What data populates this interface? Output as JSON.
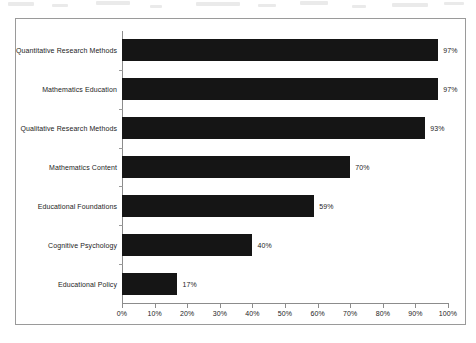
{
  "chart_data": {
    "type": "bar",
    "orientation": "horizontal",
    "title": "",
    "subtitle": "",
    "xlabel": "",
    "ylabel": "",
    "xlim": [
      0,
      100
    ],
    "grid": false,
    "legend": null,
    "categories": [
      "Quantitative Research Methods",
      "Mathematics Education",
      "Qualitative Research Methods",
      "Mathematics Content",
      "Educational Foundations",
      "Cognitive Psychology",
      "Educational Policy"
    ],
    "values": [
      97,
      97,
      93,
      70,
      59,
      40,
      17
    ],
    "value_labels": [
      "97%",
      "97%",
      "93%",
      "70%",
      "59%",
      "40%",
      "17%"
    ],
    "x_ticks": [
      0,
      10,
      20,
      30,
      40,
      50,
      60,
      70,
      80,
      90,
      100
    ],
    "x_tick_labels": [
      "0%",
      "10%",
      "20%",
      "30%",
      "40%",
      "50%",
      "60%",
      "70%",
      "80%",
      "90%",
      "100%"
    ],
    "bar_color": "#151515",
    "axis_color": "#8c8c8c",
    "frame_color": "#9a9a9a",
    "text_color": "#1c1c1c"
  }
}
